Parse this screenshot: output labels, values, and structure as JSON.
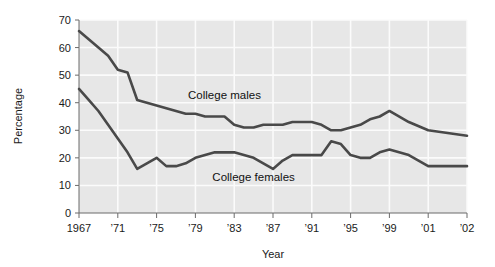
{
  "chart_data": {
    "type": "line",
    "title": "",
    "subtitle": "",
    "xlabel": "Year",
    "ylabel": "Percentage",
    "xlim": [
      1967,
      2002
    ],
    "ylim": [
      0,
      70
    ],
    "grid": true,
    "legend_position": "inline-annotation",
    "y_ticks": [
      0,
      10,
      20,
      30,
      40,
      50,
      60,
      70
    ],
    "y_tick_labels": [
      "0",
      "10",
      "20",
      "30",
      "40",
      "50",
      "60",
      "70"
    ],
    "x_ticks": [
      1967,
      1971,
      1975,
      1979,
      1983,
      1987,
      1991,
      1995,
      1999,
      2001,
      2002
    ],
    "x_tick_labels": [
      "1967",
      "’71",
      "’75",
      "’79",
      "’83",
      "’87",
      "’91",
      "’95",
      "’99",
      "’01",
      "’02"
    ],
    "x": [
      1967,
      1968,
      1969,
      1970,
      1971,
      1972,
      1973,
      1974,
      1975,
      1976,
      1977,
      1978,
      1979,
      1980,
      1981,
      1982,
      1983,
      1984,
      1985,
      1986,
      1987,
      1988,
      1989,
      1990,
      1991,
      1992,
      1993,
      1994,
      1995,
      1996,
      1997,
      1998,
      1999,
      2000,
      2001,
      2002
    ],
    "series": [
      {
        "name": "College males",
        "color": "#494949",
        "label": "College males",
        "values": [
          66,
          63,
          60,
          57,
          52,
          51,
          41,
          40,
          39,
          38,
          37,
          36,
          36,
          35,
          35,
          35,
          32,
          31,
          31,
          32,
          32,
          32,
          33,
          33,
          33,
          32,
          30,
          30,
          31,
          32,
          34,
          35,
          37,
          33,
          30,
          28
        ]
      },
      {
        "name": "College females",
        "color": "#494949",
        "label": "College females",
        "values": [
          45,
          41,
          37,
          32,
          27,
          22,
          16,
          18,
          20,
          17,
          17,
          18,
          20,
          21,
          22,
          22,
          22,
          21,
          20,
          18,
          16,
          19,
          21,
          21,
          21,
          21,
          26,
          25,
          21,
          20,
          20,
          22,
          23,
          21,
          17,
          17
        ]
      }
    ],
    "annotations": [
      {
        "text": "College males",
        "x": 1982,
        "y": 41.5
      },
      {
        "text": "College females",
        "x": 1985,
        "y": 11.5
      }
    ]
  },
  "axes": {
    "y_axis_title": "Percentage",
    "x_axis_title": "Year"
  },
  "colors": {
    "plot_background": "#e7e7e7",
    "gridline": "#fbfbfb",
    "line": "#494949",
    "axis": "#666666",
    "text": "#1a1a1a",
    "page_background": "#ffffff"
  }
}
